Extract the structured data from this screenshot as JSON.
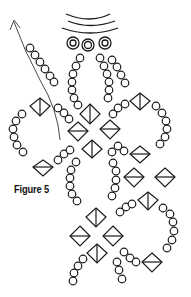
{
  "figure": {
    "label": "Figure 5",
    "type": "beadwork-diagram",
    "stroke_color": "#1a1a1a",
    "background": "#ffffff",
    "elements": {
      "seed_bead_icon": "circle",
      "bicone_icon": "diamond",
      "thread_path": "arrow-curve",
      "clasp_loops": 3
    }
  }
}
